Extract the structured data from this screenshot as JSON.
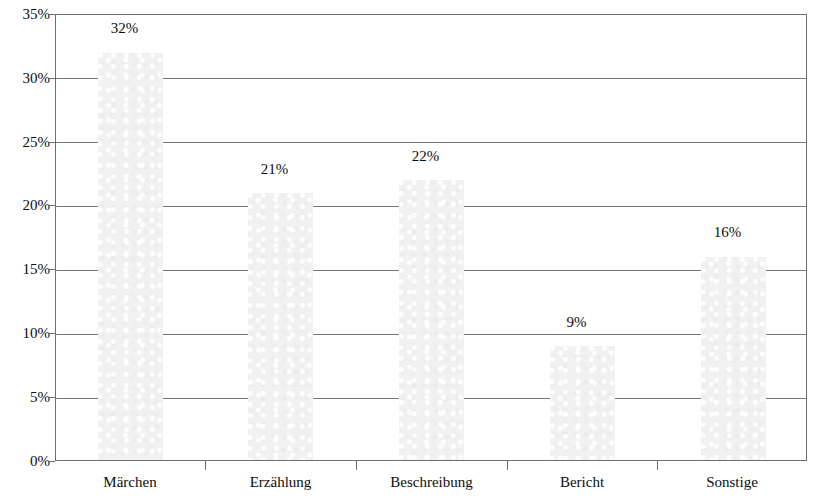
{
  "chart_data": {
    "type": "bar",
    "title": "",
    "subtitle": "",
    "xlabel": "",
    "ylabel": "",
    "categories": [
      "Märchen",
      "Erzählung",
      "Beschreibung",
      "Bericht",
      "Sonstige"
    ],
    "values": [
      32,
      21,
      22,
      9,
      16
    ],
    "data_labels": [
      "32%",
      "21%",
      "22%",
      "9%",
      "16%"
    ],
    "ylim": [
      0,
      35
    ],
    "ytick_values": [
      0,
      5,
      10,
      15,
      20,
      25,
      30,
      35
    ],
    "ytick_labels": [
      "0%",
      "5%",
      "10%",
      "15%",
      "20%",
      "25%",
      "30%",
      "35%"
    ],
    "grid": true,
    "grid_axis": "y",
    "legend": false,
    "legend_position": "none",
    "bar_fill_color": "#f1f1f1",
    "gridline_color": "#767676",
    "axis_color": "#6e6e6e",
    "text_color": "#0d0d0d",
    "background_color": "#ffffff"
  },
  "axes": {
    "y": {
      "ticks": [
        {
          "label": "35%",
          "value": 35
        },
        {
          "label": "30%",
          "value": 30
        },
        {
          "label": "25%",
          "value": 25
        },
        {
          "label": "20%",
          "value": 20
        },
        {
          "label": "15%",
          "value": 15
        },
        {
          "label": "10%",
          "value": 10
        },
        {
          "label": "5%",
          "value": 5
        },
        {
          "label": "0%",
          "value": 0
        }
      ]
    },
    "x": {
      "ticks": [
        {
          "label": "Märchen"
        },
        {
          "label": "Erzählung"
        },
        {
          "label": "Beschreibung"
        },
        {
          "label": "Bericht"
        },
        {
          "label": "Sonstige"
        }
      ]
    }
  }
}
